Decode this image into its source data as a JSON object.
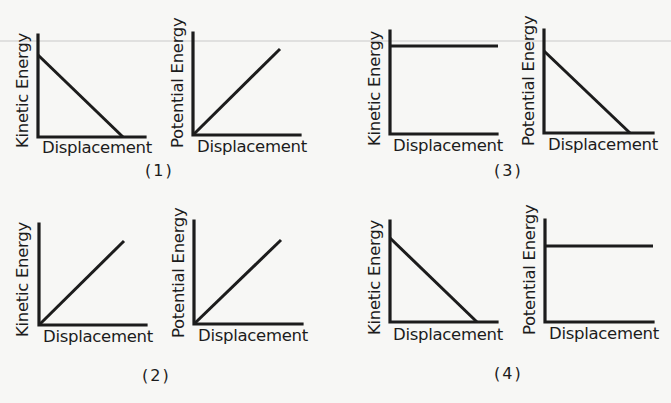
{
  "figure": {
    "background": "#f7f7f5",
    "ink": "#1c1c1c",
    "x_axis_label": "Displacement",
    "panels": [
      {
        "caption": "(1)",
        "caption_pos": [
          145,
          163
        ],
        "graphs": [
          {
            "ylabel": "Kinetic Energy",
            "origin": [
              38,
              137
            ],
            "x_end": 145,
            "y_top": 35,
            "line": [
              [
                38,
                55
              ],
              [
                123,
                137
              ]
            ],
            "shape": "decreasing"
          },
          {
            "ylabel": "Potential Energy",
            "origin": [
              193,
              135
            ],
            "x_end": 300,
            "y_top": 33,
            "line": [
              [
                193,
                135
              ],
              [
                280,
                49
              ]
            ],
            "shape": "increasing"
          }
        ]
      },
      {
        "caption": "(2)",
        "caption_pos": [
          142,
          368
        ],
        "graphs": [
          {
            "ylabel": "Kinetic Energy",
            "origin": [
              39,
              325
            ],
            "x_end": 146,
            "y_top": 224,
            "line": [
              [
                39,
                325
              ],
              [
                124,
                241
              ]
            ],
            "shape": "increasing"
          },
          {
            "ylabel": "Potential Energy",
            "origin": [
              194,
              324
            ],
            "x_end": 302,
            "y_top": 221,
            "line": [
              [
                194,
                324
              ],
              [
                281,
                240
              ]
            ],
            "shape": "increasing"
          }
        ]
      },
      {
        "caption": "(3)",
        "caption_pos": [
          494,
          163
        ],
        "graphs": [
          {
            "ylabel": "Kinetic Energy",
            "origin": [
              390,
              134
            ],
            "x_end": 497,
            "y_top": 31,
            "line": [
              [
                390,
                46
              ],
              [
                498,
                46
              ]
            ],
            "shape": "constant"
          },
          {
            "ylabel": "Potential Energy",
            "origin": [
              544,
              133
            ],
            "x_end": 653,
            "y_top": 30,
            "line": [
              [
                544,
                51
              ],
              [
                630,
                133
              ]
            ],
            "shape": "decreasing"
          }
        ]
      },
      {
        "caption": "(4)",
        "caption_pos": [
          494,
          366
        ],
        "graphs": [
          {
            "ylabel": "Kinetic Energy",
            "origin": [
              390,
              322
            ],
            "x_end": 497,
            "y_top": 221,
            "line": [
              [
                390,
                238
              ],
              [
                477,
                322
              ]
            ],
            "shape": "decreasing"
          },
          {
            "ylabel": "Potential Energy",
            "origin": [
              545,
              322
            ],
            "x_end": 653,
            "y_top": 220,
            "line": [
              [
                545,
                246
              ],
              [
                653,
                246
              ]
            ],
            "shape": "constant"
          }
        ]
      }
    ]
  }
}
